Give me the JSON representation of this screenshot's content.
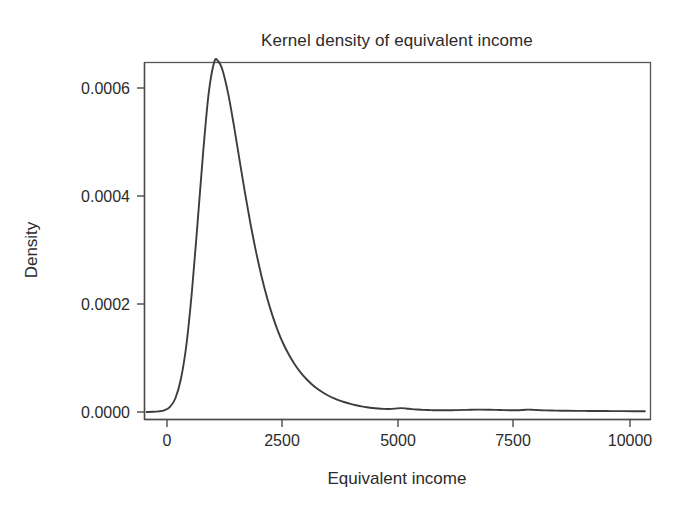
{
  "figure": {
    "title": "Kernel density of equivalent income",
    "background_color": "#ffffff",
    "curve_color": "#3d3d3d",
    "axis_color": "#4a4a4a",
    "frame_color": "#565656"
  },
  "chart_data": {
    "type": "line",
    "title": "Kernel density of equivalent income",
    "xlabel": "Equivalent income",
    "ylabel": "Density",
    "xlim": [
      -460,
      10430
    ],
    "ylim": [
      -1.5e-05,
      0.00067
    ],
    "grid": false,
    "legend": "none",
    "xticks": [
      0,
      2500,
      5000,
      7500,
      10000
    ],
    "xtick_labels": [
      "0",
      "2500",
      "5000",
      "7500",
      "10000"
    ],
    "yticks": [
      0.0,
      0.0002,
      0.0004,
      0.0006
    ],
    "ytick_labels": [
      "0.0000",
      "0.0002",
      "0.0004",
      "0.0006"
    ],
    "series": [
      {
        "name": "Kernel density of equivalent income",
        "x": [
          -440,
          -300,
          -180,
          -60,
          60,
          180,
          300,
          420,
          540,
          660,
          780,
          900,
          1020,
          1100,
          1200,
          1320,
          1440,
          1560,
          1680,
          1800,
          1920,
          2040,
          2160,
          2280,
          2400,
          2520,
          2640,
          2760,
          2880,
          3000,
          3120,
          3240,
          3360,
          3480,
          3600,
          3720,
          3840,
          3960,
          4080,
          4200,
          4320,
          4440,
          4560,
          4680,
          4800,
          4920,
          5040,
          5160,
          5280,
          5400,
          5520,
          5640,
          5760,
          5880,
          6000,
          6240,
          6480,
          6720,
          6960,
          7200,
          7440,
          7680,
          7800,
          7920,
          8040,
          8160,
          8400,
          8640,
          8880,
          9120,
          9360,
          9600,
          9840,
          10080,
          10320
        ],
        "y": [
          0.0,
          4e-07,
          1.2e-06,
          3e-06,
          9e-06,
          2.5e-05,
          6.1e-05,
          0.000125,
          0.000225,
          0.00035,
          0.00048,
          0.00059,
          0.000648,
          0.00065,
          0.000633,
          0.00059,
          0.000533,
          0.00047,
          0.000408,
          0.00035,
          0.000298,
          0.000252,
          0.000212,
          0.000178,
          0.000149,
          0.000125,
          0.000105,
          8.8e-05,
          7.4e-05,
          6.2e-05,
          5.2e-05,
          4.35e-05,
          3.65e-05,
          3.05e-05,
          2.55e-05,
          2.15e-05,
          1.8e-05,
          1.5e-05,
          1.25e-05,
          1.05e-05,
          8.8e-06,
          7.4e-06,
          6.4e-06,
          5.8e-06,
          5.6e-06,
          6.2e-06,
          7.2e-06,
          6.6e-06,
          5.4e-06,
          4.5e-06,
          4e-06,
          3.6e-06,
          3.3e-06,
          3.2e-06,
          3.2e-06,
          3.4e-06,
          3.9e-06,
          4.4e-06,
          4.2e-06,
          3.6e-06,
          3.2e-06,
          3.8e-06,
          4.4e-06,
          4e-06,
          3.4e-06,
          3e-06,
          2.6e-06,
          2.3e-06,
          2.1e-06,
          1.9e-06,
          1.8e-06,
          1.7e-06,
          1.6e-06,
          1.5e-06,
          1.4e-06
        ],
        "peak": {
          "x": 1060,
          "y": 0.00065
        }
      }
    ]
  },
  "labels": {
    "title": "Kernel density of equivalent income",
    "x_axis_title": "Equivalent income",
    "y_axis_title": "Density"
  }
}
